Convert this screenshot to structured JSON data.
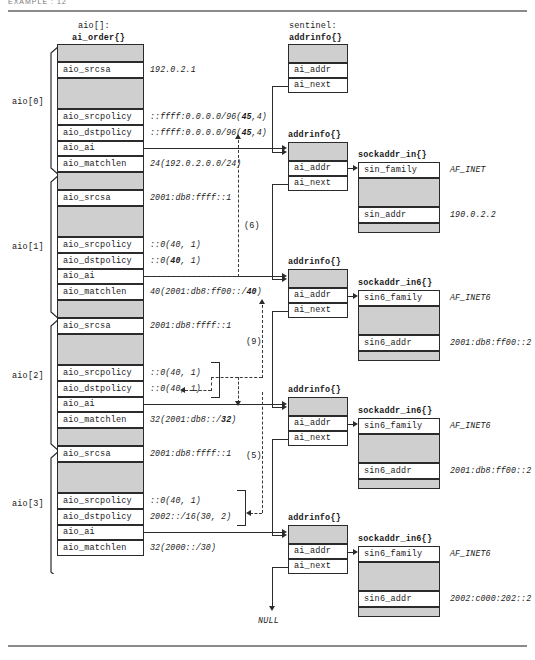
{
  "page": {
    "top_crumb": "EXAMPLE : 12",
    "null_label": "NULL"
  },
  "headers": {
    "array_name": "aio[]:",
    "array_struct": "ai_order{}",
    "sentinel_label": "sentinel:",
    "addrinfo_struct": "addrinfo{}",
    "sockaddr_in": "sockaddr_in{}",
    "sockaddr_in6": "sockaddr_in6{}"
  },
  "field_names": {
    "srcsa": "aio_srcsa",
    "srcpolicy": "aio_srcpolicy",
    "dstpolicy": "aio_dstpolicy",
    "ai": "aio_ai",
    "matchlen": "aio_matchlen",
    "ai_addr": "ai_addr",
    "ai_next": "ai_next",
    "sin_family": "sin_family",
    "sin_addr": "sin_addr",
    "sin6_family": "sin6_family",
    "sin6_addr": "sin6_addr"
  },
  "aio_entries": [
    {
      "index_label": "aio[0]",
      "srcsa": "192.0.2.1",
      "srcpolicy": "::ffff:0.0.0.0/96(45,4)",
      "srcpolicy_pre": "::ffff:0.0.0.0/96(",
      "srcpolicy_bold": "45",
      "srcpolicy_post": ",4)",
      "dstpolicy": "::ffff:0.0.0.0/96(45,4)",
      "dstpolicy_pre": "::ffff:0.0.0.0/96(",
      "dstpolicy_bold": "45",
      "dstpolicy_post": ",4)",
      "matchlen_pre": "24(192.0.2.0.0/24)",
      "matchlen_bold": "",
      "matchlen_post": ""
    },
    {
      "index_label": "aio[1]",
      "srcsa": "2001:db8:ffff::1",
      "srcpolicy_pre": "::0(40, 1)",
      "srcpolicy_bold": "",
      "srcpolicy_post": "",
      "dstpolicy_pre": "::0(",
      "dstpolicy_bold": "40",
      "dstpolicy_post": ", 1)",
      "matchlen_pre": "40(2001:db8:ff00::/",
      "matchlen_bold": "40",
      "matchlen_post": ")"
    },
    {
      "index_label": "aio[2]",
      "srcsa": "2001:db8:ffff::1",
      "srcpolicy_pre": "::0(40, 1)",
      "srcpolicy_bold": "",
      "srcpolicy_post": "",
      "dstpolicy_pre": "::0(40, 1)",
      "dstpolicy_bold": "",
      "dstpolicy_post": "",
      "matchlen_pre": "32(2001:db8::/",
      "matchlen_bold": "32",
      "matchlen_post": ")"
    },
    {
      "index_label": "aio[3]",
      "srcsa": "2001:db8:ffff::1",
      "srcpolicy_pre": "::0(40, 1)",
      "srcpolicy_bold": "",
      "srcpolicy_post": "",
      "dstpolicy_pre": "2002::/16(30, 2)",
      "dstpolicy_bold": "",
      "dstpolicy_post": "",
      "matchlen_pre": "32(2000::/30)",
      "matchlen_bold": "",
      "matchlen_post": ""
    }
  ],
  "addrinfo_nodes": [
    {
      "name": "sentinel"
    },
    {
      "name": "node1"
    },
    {
      "name": "node2"
    },
    {
      "name": "node3"
    },
    {
      "name": "node4"
    }
  ],
  "sockaddrs": [
    {
      "struct_name": "sockaddr_in{}",
      "family_field": "sin_family",
      "family_value": "AF_INET",
      "addr_field": "sin_addr",
      "addr_value": "190.0.2.2"
    },
    {
      "struct_name": "sockaddr_in6{}",
      "family_field": "sin6_family",
      "family_value": "AF_INET6",
      "addr_field": "sin6_addr",
      "addr_value": "2001:db8:ff00::2"
    },
    {
      "struct_name": "sockaddr_in6{}",
      "family_field": "sin6_family",
      "family_value": "AF_INET6",
      "addr_field": "sin6_addr",
      "addr_value": "2001:db8:ff00::2"
    },
    {
      "struct_name": "sockaddr_in6{}",
      "family_field": "sin6_family",
      "family_value": "AF_INET6",
      "addr_field": "sin6_addr",
      "addr_value": "2002:c000:202::2"
    }
  ],
  "step_labels": {
    "s6": "(6)",
    "s9": "(9)",
    "s5": "(5)"
  }
}
